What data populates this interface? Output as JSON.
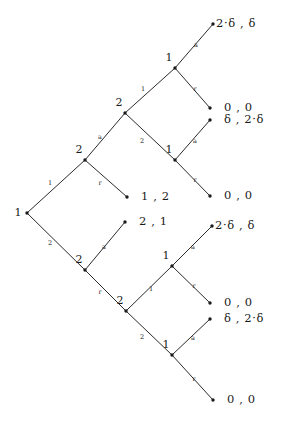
{
  "figure": {
    "type": "extensive-form-game-tree",
    "background": "#ffffff",
    "ink": "#1a1a1a"
  },
  "nodes": [
    {
      "id": "root",
      "label": "1",
      "x": 27,
      "y": 213,
      "label_x": 18,
      "label_y": 213,
      "label_pos": "left"
    },
    {
      "id": "u2a",
      "label": "2",
      "x": 85,
      "y": 160,
      "label_x": 79,
      "label_y": 150,
      "label_pos": "above-left"
    },
    {
      "id": "u2b",
      "label": "2",
      "x": 125,
      "y": 113,
      "label_x": 119,
      "label_y": 103,
      "label_pos": "above-left"
    },
    {
      "id": "u1top",
      "label": "1",
      "x": 175,
      "y": 68,
      "label_x": 169,
      "label_y": 58,
      "label_pos": "above-left"
    },
    {
      "id": "u1mid",
      "label": "1",
      "x": 175,
      "y": 160,
      "label_x": 169,
      "label_y": 150,
      "label_pos": "above-left"
    },
    {
      "id": "l2a",
      "label": "2",
      "x": 85,
      "y": 270,
      "label_x": 79,
      "label_y": 260,
      "label_pos": "above-left"
    },
    {
      "id": "l2b",
      "label": "2",
      "x": 126,
      "y": 311,
      "label_x": 120,
      "label_y": 301,
      "label_pos": "above-left"
    },
    {
      "id": "l1top",
      "label": "1",
      "x": 172,
      "y": 266,
      "label_x": 166,
      "label_y": 256,
      "label_pos": "above-left"
    },
    {
      "id": "l1bot",
      "label": "1",
      "x": 172,
      "y": 355,
      "label_x": 166,
      "label_y": 345,
      "label_pos": "above-left"
    }
  ],
  "terminals": [
    {
      "id": "t1",
      "x": 213,
      "y": 24,
      "payoff": "2·δ , δ",
      "text_x": 216,
      "text_y": 24
    },
    {
      "id": "t2",
      "x": 210,
      "y": 108,
      "payoff": "0 , 0",
      "text_x": 224,
      "text_y": 108
    },
    {
      "id": "t3",
      "x": 210,
      "y": 120,
      "payoff": "δ , 2·δ",
      "text_x": 224,
      "text_y": 120
    },
    {
      "id": "t4",
      "x": 210,
      "y": 196,
      "payoff": "0 , 0",
      "text_x": 224,
      "text_y": 196
    },
    {
      "id": "t5",
      "x": 127,
      "y": 197,
      "payoff": "1 , 2",
      "text_x": 141,
      "text_y": 197
    },
    {
      "id": "t6",
      "x": 125,
      "y": 222,
      "payoff": "2 , 1",
      "text_x": 139,
      "text_y": 222
    },
    {
      "id": "t7",
      "x": 212,
      "y": 226,
      "payoff": "2·δ , δ",
      "text_x": 215,
      "text_y": 226
    },
    {
      "id": "t8",
      "x": 210,
      "y": 303,
      "payoff": "0 , 0",
      "text_x": 224,
      "text_y": 303
    },
    {
      "id": "t9",
      "x": 210,
      "y": 319,
      "payoff": "δ , 2·δ",
      "text_x": 224,
      "text_y": 319
    },
    {
      "id": "t10",
      "x": 213,
      "y": 400,
      "payoff": "0 , 0",
      "text_x": 227,
      "text_y": 400
    }
  ],
  "edges": [
    {
      "id": "e1",
      "from": "root",
      "to": "u2a",
      "label": "1",
      "lx": 50,
      "ly": 183
    },
    {
      "id": "e2",
      "from": "root",
      "to": "l2a",
      "label": "2",
      "lx": 50,
      "ly": 243
    },
    {
      "id": "e3",
      "from": "u2a",
      "to": "u2b",
      "label": "a",
      "lx": 100,
      "ly": 137
    },
    {
      "id": "e4",
      "from": "u2a",
      "to": "t5",
      "label": "r",
      "lx": 100,
      "ly": 183
    },
    {
      "id": "e5",
      "from": "u2b",
      "to": "u1top",
      "label": "1",
      "lx": 143,
      "ly": 89
    },
    {
      "id": "e6",
      "from": "u2b",
      "to": "u1mid",
      "label": "2",
      "lx": 142,
      "ly": 141
    },
    {
      "id": "e7",
      "from": "u1top",
      "to": "t1",
      "label": "a",
      "lx": 196,
      "ly": 45
    },
    {
      "id": "e8",
      "from": "u1top",
      "to": "t2",
      "label": "r",
      "lx": 195,
      "ly": 89
    },
    {
      "id": "e9",
      "from": "u1mid",
      "to": "t3",
      "label": "a",
      "lx": 195,
      "ly": 141
    },
    {
      "id": "e10",
      "from": "u1mid",
      "to": "t4",
      "label": "r",
      "lx": 195,
      "ly": 180
    },
    {
      "id": "e11",
      "from": "l2a",
      "to": "t6",
      "label": "a",
      "lx": 104,
      "ly": 247
    },
    {
      "id": "e12",
      "from": "l2a",
      "to": "l2b",
      "label": "r",
      "lx": 100,
      "ly": 292
    },
    {
      "id": "e13",
      "from": "l2b",
      "to": "l1top",
      "label": "1",
      "lx": 151,
      "ly": 289
    },
    {
      "id": "e14",
      "from": "l2b",
      "to": "l1bot",
      "label": "2",
      "lx": 142,
      "ly": 337
    },
    {
      "id": "e15",
      "from": "l1top",
      "to": "t7",
      "label": "a",
      "lx": 193,
      "ly": 247
    },
    {
      "id": "e16",
      "from": "l1top",
      "to": "t8",
      "label": "r",
      "lx": 194,
      "ly": 286
    },
    {
      "id": "e17",
      "from": "l1bot",
      "to": "t9",
      "label": "a",
      "lx": 193,
      "ly": 338
    },
    {
      "id": "e18",
      "from": "l1bot",
      "to": "t10",
      "label": "r",
      "lx": 194,
      "ly": 379
    }
  ]
}
